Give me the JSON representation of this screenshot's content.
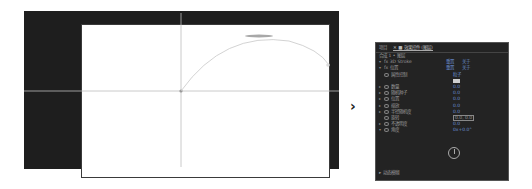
{
  "viewer": {
    "background_color": "#1e1e1e",
    "comp_color": "#ffffff",
    "guide_color": "#bdbdbd",
    "motion_path": {
      "start": [
        180,
        91
      ],
      "peak": [
        250,
        36
      ],
      "end": [
        328,
        66
      ]
    }
  },
  "arrow": {
    "glyph": "›"
  },
  "panel": {
    "tabs": [
      {
        "label": "项目"
      },
      {
        "label": "✕ ■ 效果控件 (图层)"
      }
    ],
    "title": "合成 1 • 图层",
    "rows": [
      {
        "label": "fx 3D Stroke",
        "value": "重置",
        "value2": "关于"
      },
      {
        "label": "fx 位置",
        "value": "重置",
        "value2": "关于"
      },
      {
        "label": "属性控制",
        "value": "粒子"
      },
      {
        "label": "",
        "value": "color"
      },
      {
        "label": "数量",
        "value": "0.0"
      },
      {
        "label": "随机种子",
        "value": "0.0"
      },
      {
        "label": "位置",
        "value": "0.0"
      },
      {
        "label": "缩放",
        "value": "0.0"
      },
      {
        "label": "半径随机度",
        "value": "0.0"
      },
      {
        "label": "旋转",
        "value": "0.0, 0.0"
      },
      {
        "label": "不透明度",
        "value": "0.0"
      },
      {
        "label": "角度",
        "value": "0x+0.0°"
      }
    ],
    "footer": "▸ 动态模糊"
  }
}
